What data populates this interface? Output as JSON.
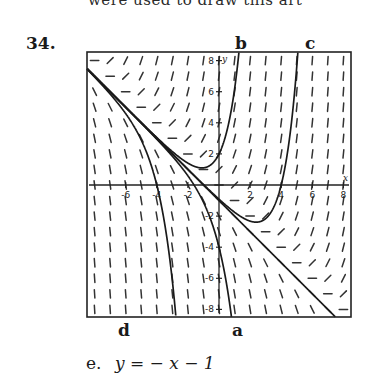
{
  "header_fragment": "were used to draw this art",
  "problem_number": "34.",
  "curve_labels": {
    "b": "b",
    "c": "c",
    "d": "d",
    "a": "a"
  },
  "answer": {
    "prefix": "e.",
    "equation": "y = − x − 1"
  },
  "chart_data": {
    "type": "line",
    "xlabel": "x",
    "ylabel": "y",
    "xlim": [
      -8.5,
      8.5
    ],
    "ylim": [
      -8.5,
      8.5
    ],
    "x_ticks": [
      -6,
      -4,
      -2,
      2,
      4,
      6,
      8
    ],
    "y_ticks": [
      8,
      6,
      4,
      2,
      -2,
      -4,
      -6,
      -8
    ],
    "x_tick_labels": [
      "-6",
      "-4",
      "-2",
      "2",
      "4",
      "6",
      "8"
    ],
    "y_tick_labels": [
      "8",
      "6",
      "4",
      "2",
      "-2",
      "-4",
      "-6",
      "-8"
    ],
    "grid": false,
    "slope_field": {
      "equation": "dy/dx = x + y",
      "x_range": [
        -8,
        8
      ],
      "y_range": [
        -8,
        8
      ],
      "step": 1
    },
    "series": [
      {
        "name": "a",
        "C": -3,
        "formula": "y = -3e^x - x - 1"
      },
      {
        "name": "b",
        "C": 3,
        "formula": "y = 3e^x - x - 1"
      },
      {
        "name": "c",
        "C": 0.0916,
        "formula": "y = 5e^(x-4) - x - 1"
      },
      {
        "name": "d",
        "C": -164,
        "formula": "y = -3e^(x+4) - x - 1"
      },
      {
        "name": "e",
        "C": 0,
        "formula": "y = -x - 1"
      }
    ]
  }
}
